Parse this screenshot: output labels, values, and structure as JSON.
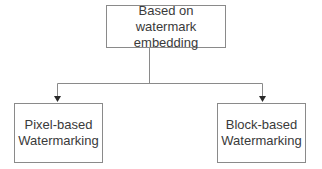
{
  "diagram": {
    "type": "tree",
    "root": {
      "lines": [
        "Based on watermark",
        "embedding"
      ]
    },
    "children": [
      {
        "lines": [
          "Pixel-based",
          "Watermarking"
        ]
      },
      {
        "lines": [
          "Block-based",
          "Watermarking"
        ]
      }
    ],
    "edges": [
      {
        "from": "root",
        "to": "children.0",
        "style": "arrow"
      },
      {
        "from": "root",
        "to": "children.1",
        "style": "arrow"
      }
    ],
    "colors": {
      "line": "#8a8a8a",
      "text": "#3a3a3a",
      "arrowhead": "#2a2a2a",
      "background": "#ffffff"
    }
  }
}
